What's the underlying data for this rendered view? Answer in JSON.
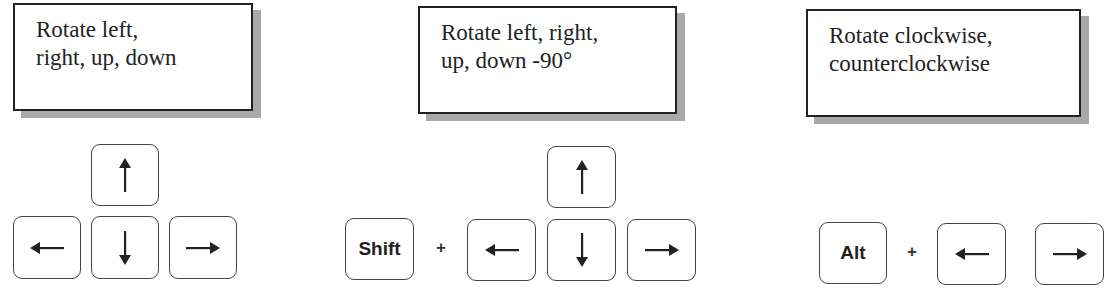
{
  "panels": [
    {
      "caption_line1": "Rotate left,",
      "caption_line2": "right, up, down",
      "keys": [
        "up-arrow",
        "left-arrow",
        "down-arrow",
        "right-arrow"
      ]
    },
    {
      "caption_line1": "Rotate left, right,",
      "caption_line2": "up, down -90°",
      "modifier": "Shift",
      "plus": "+",
      "keys": [
        "up-arrow",
        "left-arrow",
        "down-arrow",
        "right-arrow"
      ]
    },
    {
      "caption_line1": "Rotate clockwise,",
      "caption_line2": "counterclockwise",
      "modifier": "Alt",
      "plus": "+",
      "keys": [
        "left-arrow",
        "right-arrow"
      ]
    }
  ]
}
